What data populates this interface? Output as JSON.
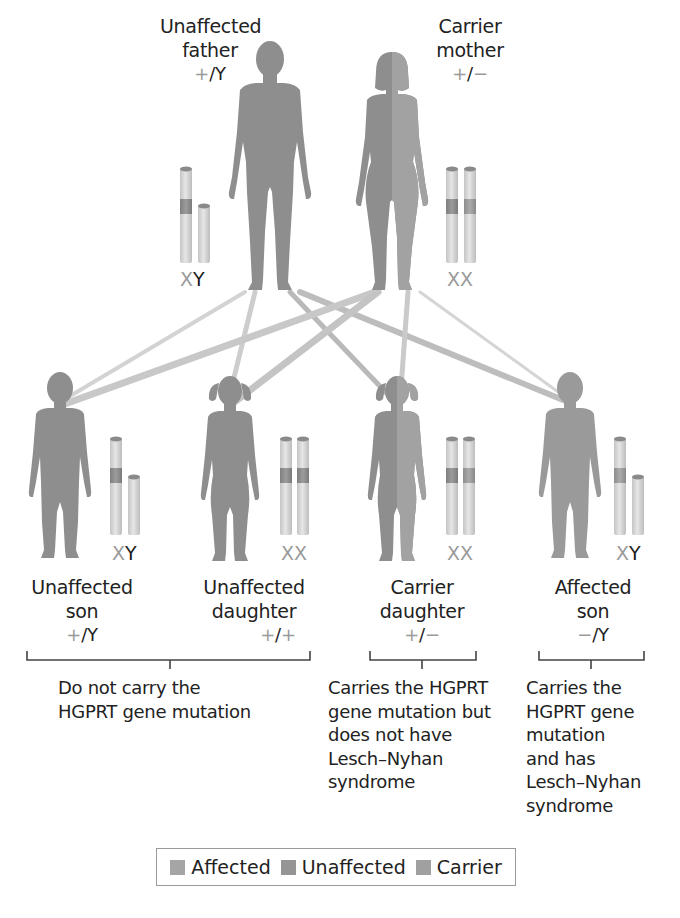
{
  "colors": {
    "figure": "#8f8f8f",
    "figure_carrier_half": "#a3a3a3",
    "chromosome_body": "#d9d9d9",
    "chromosome_band_normal": "#8a8a8a",
    "chromosome_band_mutant": "#a8a8a8",
    "line_father": "#cfcfcf",
    "line_mother": "#bdbdbd",
    "legend_affected": "#a5a5a5",
    "legend_unaffected": "#959595",
    "legend_carrier": "#a0a0a0",
    "bracket": "#444444"
  },
  "parents": {
    "father": {
      "label_line1": "Unaffected",
      "label_line2": "father",
      "genotype_allele": "+",
      "genotype_rest": "/Y",
      "chromosomes_first": "X",
      "chromosomes_second": "Y"
    },
    "mother": {
      "label_line1": "Carrier",
      "label_line2": "mother",
      "genotype_allele1": "+",
      "genotype_sep": "/",
      "genotype_allele2": "−",
      "chromosomes_first": "X",
      "chromosomes_second": "X"
    }
  },
  "children": [
    {
      "label_line1": "Unaffected",
      "label_line2": "son",
      "genotype_a": "+",
      "genotype_b": "/Y",
      "chromosomes_first": "X",
      "chromosomes_second": "Y"
    },
    {
      "label_line1": "Unaffected",
      "label_line2": "daughter",
      "genotype_a": "+",
      "genotype_sep": "/",
      "genotype_b": "+",
      "chromosomes_first": "X",
      "chromosomes_second": "X"
    },
    {
      "label_line1": "Carrier",
      "label_line2": "daughter",
      "genotype_a": "+",
      "genotype_sep": "/",
      "genotype_b": "−",
      "chromosomes_first": "X",
      "chromosomes_second": "X"
    },
    {
      "label_line1": "Affected",
      "label_line2": "son",
      "genotype_a": "−",
      "genotype_b": "/Y",
      "chromosomes_first": "X",
      "chromosomes_second": "Y"
    }
  ],
  "groups": [
    {
      "description": "Do not carry the\nHGPRT gene mutation"
    },
    {
      "description": "Carries the HGPRT\ngene mutation but\ndoes not have\nLesch–Nyhan\nsyndrome"
    },
    {
      "description": "Carries the\nHGPRT gene\nmutation\nand has\nLesch–Nyhan\nsyndrome"
    }
  ],
  "legend": {
    "items": [
      {
        "label": "Affected"
      },
      {
        "label": "Unaffected"
      },
      {
        "label": "Carrier"
      }
    ]
  }
}
